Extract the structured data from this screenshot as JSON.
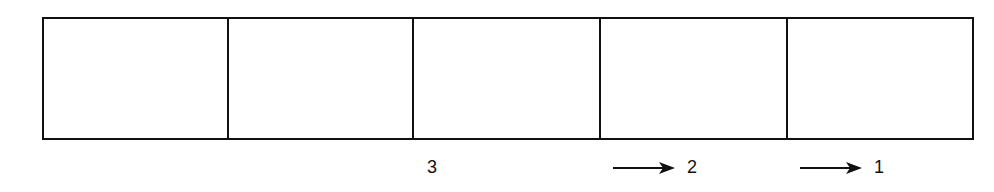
{
  "diagram": {
    "type": "horizontal-cell-strip",
    "line_color": "#111111",
    "background": "#ffffff",
    "cells": [
      {
        "index": 1,
        "left": 0,
        "width": 185,
        "content": ""
      },
      {
        "index": 2,
        "left": 185,
        "width": 185,
        "content": ""
      },
      {
        "index": 3,
        "left": 370,
        "width": 187,
        "content": ""
      },
      {
        "index": 4,
        "left": 557,
        "width": 187,
        "content": ""
      },
      {
        "index": 5,
        "left": 744,
        "width": 188,
        "content": ""
      }
    ],
    "labels": [
      {
        "text": "3",
        "under_cell": 3,
        "arrow": false,
        "icon": null
      },
      {
        "text": "2",
        "under_cell": 4,
        "arrow": true,
        "icon": "right-arrow-icon"
      },
      {
        "text": "1",
        "under_cell": 5,
        "arrow": true,
        "icon": "right-arrow-icon"
      }
    ]
  }
}
